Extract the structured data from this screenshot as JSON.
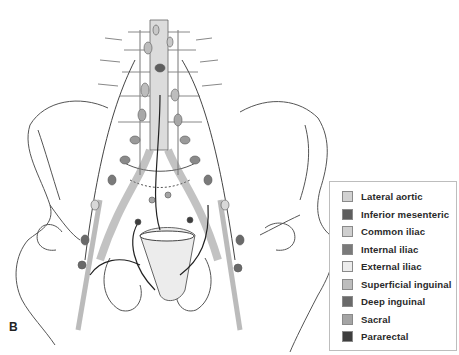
{
  "figure": {
    "panel_label": "B"
  },
  "legend": {
    "items": [
      {
        "label": "Lateral aortic",
        "color": "#d2d2d2"
      },
      {
        "label": "Inferior mesenteric",
        "color": "#5e5e5e"
      },
      {
        "label": "Common iliac",
        "color": "#cfcfcf"
      },
      {
        "label": "Internal iliac",
        "color": "#7a7a7a"
      },
      {
        "label": "External iliac",
        "color": "#ececec"
      },
      {
        "label": "Superficial inguinal",
        "color": "#bdbdbd"
      },
      {
        "label": "Deep inguinal",
        "color": "#6a6a6a"
      },
      {
        "label": "Sacral",
        "color": "#a4a4a4"
      },
      {
        "label": "Pararectal",
        "color": "#3e3e3e"
      }
    ]
  },
  "colors": {
    "line": "#4a4a4a",
    "vessel_fill": "#d8d8d8",
    "node_mid": "#9a9a9a",
    "node_dark": "#6a6a6a"
  }
}
